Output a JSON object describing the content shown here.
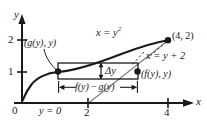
{
  "figure": {
    "kind": "cartesian-graph",
    "background_color": "#ffffff",
    "ink_color": "#1a1a1a"
  },
  "axes": {
    "x_axis_label": "x",
    "y_axis_label": "y",
    "origin_label": "0",
    "x_ticks": [
      {
        "label": "2",
        "value": 2
      },
      {
        "label": "4",
        "value": 4
      }
    ],
    "y_ticks": [
      {
        "label": "1",
        "value": 1
      },
      {
        "label": "2",
        "value": 2
      }
    ],
    "x_range": [
      -0.2,
      5.0
    ],
    "y_range": [
      -0.6,
      2.6
    ]
  },
  "curves": [
    {
      "name": "parabola",
      "label_prefix": "x = y",
      "label_exponent": "2",
      "label_full": "x = y²",
      "equation": "x = y^2",
      "style": "solid-thick"
    },
    {
      "name": "line",
      "label": "x = y + 2",
      "equation": "x = y + 2",
      "style": "solid-thick"
    }
  ],
  "points": [
    {
      "name": "left-endpoint",
      "label": "(g(y), y)",
      "marker": "filled-dot",
      "coords": [
        1,
        1
      ]
    },
    {
      "name": "right-endpoint",
      "label": "(f(y), y)",
      "marker": "filled-dot",
      "coords": [
        3,
        1
      ]
    },
    {
      "name": "intersection-upper",
      "label": "(4, 2)",
      "marker": "filled-dot",
      "coords": [
        4,
        2
      ]
    }
  ],
  "annotations": {
    "thickness_label": "Δy",
    "width_label_prefix": "f(y)",
    "width_label_minus": "−",
    "width_label_suffix": "g(y)",
    "width_label_full": "f(y) − g(y)",
    "baseline_label": "y = 0"
  },
  "rectangle": {
    "name": "representative-rectangle",
    "x_left": 1,
    "x_right": 3,
    "y_bottom": 0.78,
    "y_top": 1.28
  }
}
